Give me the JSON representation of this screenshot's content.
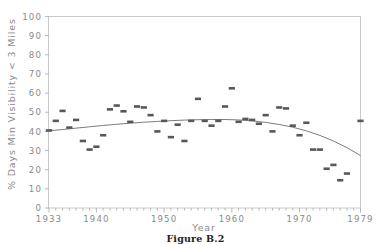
{
  "figure": {
    "caption": "Figure B.2"
  },
  "chart_data": {
    "type": "scatter",
    "title": "",
    "xlabel": "Year",
    "ylabel": "% Days Min Visibility < 3 Miles",
    "xlim": [
      1933,
      1979
    ],
    "ylim": [
      0,
      100
    ],
    "grid": false,
    "legend": "none",
    "xticks": [
      1933,
      1940,
      1950,
      1960,
      1970,
      1979
    ],
    "xtick_labels": [
      "1933",
      "1940",
      "1950",
      "1960",
      "1970",
      "1979"
    ],
    "yticks": [
      0,
      10,
      20,
      30,
      40,
      50,
      60,
      70,
      80,
      90,
      100
    ],
    "ytick_labels": [
      "0",
      "10",
      "20",
      "30",
      "40",
      "50",
      "60",
      "70",
      "80",
      "90",
      "100"
    ],
    "x_minor_tick_interval": 1,
    "marker_style": "filled-rectangle",
    "marker_color": "#58585c",
    "fit_curve": {
      "label": "quadratic fit",
      "color": "#6d6d6d",
      "x": [
        1933,
        1935,
        1937,
        1939,
        1941,
        1943,
        1945,
        1947,
        1949,
        1951,
        1953,
        1955,
        1957,
        1959,
        1961,
        1963,
        1965,
        1967,
        1969,
        1971,
        1973,
        1975,
        1977,
        1979
      ],
      "y": [
        40.3,
        41.0,
        41.7,
        42.4,
        43.1,
        43.7,
        44.3,
        44.8,
        45.2,
        45.6,
        45.9,
        46.1,
        46.2,
        46.2,
        46.0,
        45.5,
        44.7,
        43.6,
        42.2,
        40.3,
        37.9,
        35.0,
        31.5,
        27.4
      ]
    },
    "x": [
      1933,
      1934,
      1935,
      1936,
      1937,
      1938,
      1939,
      1940,
      1941,
      1942,
      1943,
      1944,
      1945,
      1946,
      1947,
      1948,
      1949,
      1950,
      1951,
      1952,
      1953,
      1954,
      1955,
      1956,
      1957,
      1958,
      1959,
      1960,
      1961,
      1962,
      1963,
      1964,
      1965,
      1966,
      1967,
      1968,
      1969,
      1970,
      1971,
      1972,
      1973,
      1974,
      1975,
      1976,
      1977,
      1979
    ],
    "y": [
      40.5,
      45.5,
      50.7,
      42.0,
      46.0,
      35.0,
      30.5,
      32.0,
      38.0,
      51.5,
      53.5,
      50.5,
      45.0,
      53.0,
      52.5,
      48.5,
      40.0,
      45.5,
      37.0,
      43.5,
      35.0,
      45.5,
      57.0,
      45.5,
      43.0,
      45.5,
      53.0,
      62.5,
      45.0,
      46.5,
      46.0,
      44.0,
      48.5,
      40.0,
      52.5,
      52.0,
      43.0,
      38.0,
      44.5,
      30.5,
      30.5,
      20.5,
      22.5,
      14.5,
      18.0,
      45.5
    ],
    "points": [
      {
        "x": 1933,
        "y": 40.5
      },
      {
        "x": 1934,
        "y": 45.5
      },
      {
        "x": 1935,
        "y": 50.7
      },
      {
        "x": 1936,
        "y": 42.0
      },
      {
        "x": 1937,
        "y": 46.0
      },
      {
        "x": 1938,
        "y": 35.0
      },
      {
        "x": 1939,
        "y": 30.5
      },
      {
        "x": 1940,
        "y": 32.0
      },
      {
        "x": 1941,
        "y": 38.0
      },
      {
        "x": 1942,
        "y": 51.5
      },
      {
        "x": 1943,
        "y": 53.5
      },
      {
        "x": 1944,
        "y": 50.5
      },
      {
        "x": 1945,
        "y": 45.0
      },
      {
        "x": 1946,
        "y": 53.0
      },
      {
        "x": 1947,
        "y": 52.5
      },
      {
        "x": 1948,
        "y": 48.5
      },
      {
        "x": 1949,
        "y": 40.0
      },
      {
        "x": 1950,
        "y": 45.5
      },
      {
        "x": 1951,
        "y": 37.0
      },
      {
        "x": 1952,
        "y": 43.5
      },
      {
        "x": 1953,
        "y": 35.0
      },
      {
        "x": 1954,
        "y": 45.5
      },
      {
        "x": 1955,
        "y": 57.0
      },
      {
        "x": 1956,
        "y": 45.5
      },
      {
        "x": 1957,
        "y": 43.0
      },
      {
        "x": 1958,
        "y": 45.5
      },
      {
        "x": 1959,
        "y": 53.0
      },
      {
        "x": 1960,
        "y": 62.5
      },
      {
        "x": 1961,
        "y": 45.0
      },
      {
        "x": 1962,
        "y": 46.5
      },
      {
        "x": 1963,
        "y": 46.0
      },
      {
        "x": 1964,
        "y": 44.0
      },
      {
        "x": 1965,
        "y": 48.5
      },
      {
        "x": 1966,
        "y": 40.0
      },
      {
        "x": 1967,
        "y": 52.5
      },
      {
        "x": 1968,
        "y": 52.0
      },
      {
        "x": 1969,
        "y": 43.0
      },
      {
        "x": 1970,
        "y": 38.0
      },
      {
        "x": 1971,
        "y": 44.5
      },
      {
        "x": 1972,
        "y": 30.5
      },
      {
        "x": 1973,
        "y": 30.5
      },
      {
        "x": 1974,
        "y": 20.5
      },
      {
        "x": 1975,
        "y": 22.5
      },
      {
        "x": 1976,
        "y": 14.5
      },
      {
        "x": 1977,
        "y": 18.0
      },
      {
        "x": 1979,
        "y": 45.5
      }
    ]
  }
}
